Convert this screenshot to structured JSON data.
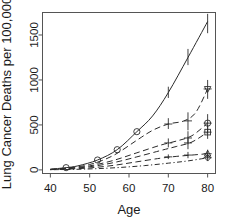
{
  "chart_data": {
    "type": "line",
    "title": "",
    "xlabel": "Age",
    "ylabel": "Lung Cancer Deaths per 100,000",
    "xlim": [
      38,
      82
    ],
    "ylim": [
      -40,
      1750
    ],
    "xticks": [
      40,
      50,
      60,
      70,
      80
    ],
    "xticklabels": [
      "40",
      "50",
      "60",
      "70",
      "80"
    ],
    "yticks": [
      0,
      500,
      1000,
      1500
    ],
    "yticklabels": [
      "0",
      "500",
      "1000",
      "1500"
    ],
    "grid": false,
    "legend": "none",
    "box": true,
    "series": [
      {
        "name": "series-1-solid",
        "linestyle": "solid",
        "marker": "circle",
        "x": [
          40,
          44,
          47,
          52,
          57,
          62,
          66,
          70,
          75,
          80
        ],
        "y": [
          8,
          25,
          45,
          110,
          225,
          425,
          600,
          860,
          1250,
          1650
        ],
        "markers_x": [
          44,
          52,
          57,
          62
        ],
        "markers_y": [
          25,
          110,
          225,
          425
        ],
        "errorbars": [
          {
            "x": 70,
            "y": 860,
            "lo": 800,
            "hi": 925
          },
          {
            "x": 75,
            "y": 1250,
            "lo": 1165,
            "hi": 1345
          },
          {
            "x": 80,
            "y": 1650,
            "lo": 1520,
            "hi": 1735
          }
        ]
      },
      {
        "name": "series-2-dashed",
        "linestyle": "dashed",
        "marker": "triangle-down",
        "x": [
          40,
          44,
          50,
          56,
          62,
          66,
          70,
          74,
          77,
          80
        ],
        "y": [
          6,
          20,
          60,
          160,
          330,
          440,
          510,
          545,
          640,
          900
        ],
        "markers_x": [
          80
        ],
        "markers_y": [
          900
        ],
        "errorbars": [
          {
            "x": 70,
            "y": 510,
            "lo": 455,
            "hi": 575
          },
          {
            "x": 75,
            "y": 545,
            "lo": 440,
            "hi": 640
          },
          {
            "x": 80,
            "y": 900,
            "lo": 790,
            "hi": 1000
          }
        ]
      },
      {
        "name": "series-3-dashed",
        "linestyle": "dashed",
        "marker": "circle",
        "x": [
          40,
          44,
          50,
          56,
          62,
          68,
          72,
          76,
          80
        ],
        "y": [
          5,
          15,
          45,
          105,
          190,
          275,
          320,
          380,
          520
        ],
        "markers_x": [
          80
        ],
        "markers_y": [
          520
        ],
        "errorbars": [
          {
            "x": 70,
            "y": 300,
            "lo": 250,
            "hi": 350
          },
          {
            "x": 75,
            "y": 355,
            "lo": 285,
            "hi": 430
          },
          {
            "x": 80,
            "y": 520,
            "lo": 405,
            "hi": 620
          }
        ]
      },
      {
        "name": "series-4-dashed",
        "linestyle": "dashed",
        "marker": "square",
        "x": [
          40,
          44,
          50,
          56,
          62,
          68,
          72,
          76,
          80
        ],
        "y": [
          4,
          12,
          35,
          80,
          145,
          215,
          260,
          310,
          420
        ],
        "markers_x": [
          80
        ],
        "markers_y": [
          420
        ],
        "errorbars": [
          {
            "x": 75,
            "y": 300,
            "lo": 230,
            "hi": 370
          },
          {
            "x": 80,
            "y": 420,
            "lo": 345,
            "hi": 500
          }
        ]
      },
      {
        "name": "series-5-dashed",
        "linestyle": "dashed",
        "marker": "triangle-up",
        "x": [
          40,
          44,
          50,
          56,
          62,
          68,
          72,
          76,
          80
        ],
        "y": [
          3,
          8,
          22,
          50,
          90,
          130,
          150,
          165,
          180
        ],
        "markers_x": [
          80
        ],
        "markers_y": [
          180
        ],
        "errorbars": [
          {
            "x": 70,
            "y": 145,
            "lo": 120,
            "hi": 172
          },
          {
            "x": 75,
            "y": 165,
            "lo": 130,
            "hi": 200
          },
          {
            "x": 80,
            "y": 180,
            "lo": 140,
            "hi": 225
          }
        ]
      },
      {
        "name": "series-6-dotdash",
        "linestyle": "dotdash",
        "marker": "diamond",
        "x": [
          40,
          46,
          52,
          58,
          64,
          70,
          75,
          80
        ],
        "y": [
          2,
          6,
          14,
          28,
          48,
          75,
          100,
          135
        ],
        "markers_x": [
          80
        ],
        "markers_y": [
          135
        ],
        "errorbars": [
          {
            "x": 80,
            "y": 135,
            "lo": 100,
            "hi": 170
          }
        ]
      }
    ],
    "colors": {
      "line": "#2b2b2b",
      "axis": "#555555",
      "text": "#1a1a1a",
      "background": "#ffffff"
    }
  }
}
